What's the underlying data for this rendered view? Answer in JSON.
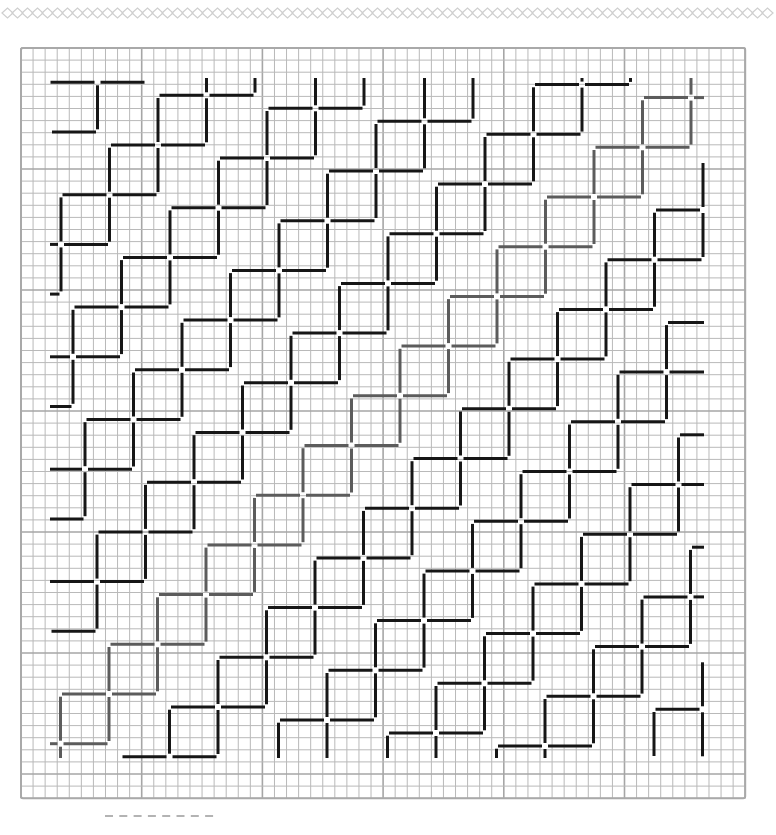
{
  "page": {
    "background": "#ffffff"
  },
  "top_border": {
    "style": "diamond-chain",
    "y": 13,
    "x_start": 2,
    "x_end": 774,
    "diamond_width": 11,
    "diamond_height": 10,
    "color": "#cfcfcf"
  },
  "grid": {
    "left": 21,
    "top": 48,
    "cols": 60,
    "rows": 62,
    "cell_w": 12.07,
    "cell_h": 12.1,
    "line_color": "#b9b9b9",
    "major_every": 10,
    "major_color": "#a6a6a6",
    "border_color": "#a9a9a9"
  },
  "pattern": {
    "motif": "diagonal-chain-of-squares",
    "origin": [
      158,
      145
    ],
    "step_along_chain": [
      -48.5,
      49.7
    ],
    "step_between_chains": [
      109,
      13
    ],
    "arm_length": 47,
    "center_gap": 3,
    "stroke_width": 3,
    "bounds": {
      "left": 50,
      "top": 78,
      "right": 704,
      "bottom": 758
    },
    "chain_range": [
      -8,
      10
    ],
    "node_range": [
      -16,
      18
    ],
    "default_color": "#161616",
    "highlight_chains": [
      {
        "chain_index": 4,
        "color": "#5c5c5c"
      }
    ]
  },
  "footer_dashes": {
    "y": 816,
    "x_start": 105,
    "count": 8,
    "dash_length": 8,
    "spacing": 14.3,
    "color": "#9a9a9a"
  }
}
